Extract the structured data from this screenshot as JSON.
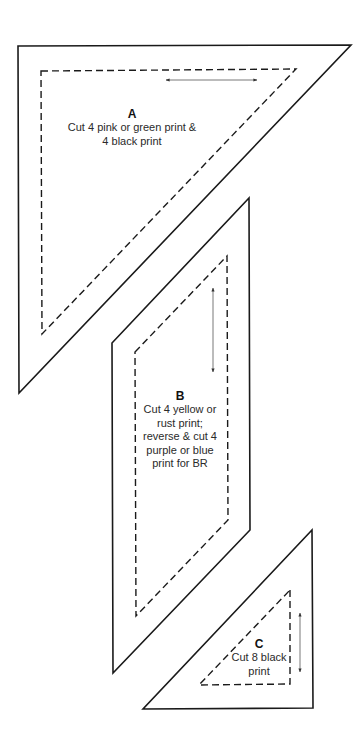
{
  "pieces": [
    {
      "id": "A",
      "letter": "A",
      "instructions": [
        "Cut 4 pink or green print &",
        "4 black print"
      ],
      "grainline": "horizontal"
    },
    {
      "id": "B",
      "letter": "B",
      "instructions": [
        "Cut 4 yellow or",
        "rust print;",
        "reverse & cut 4",
        "purple or blue",
        "print for BR"
      ],
      "grainline": "vertical"
    },
    {
      "id": "C",
      "letter": "C",
      "instructions": [
        "Cut 8 black",
        "print"
      ],
      "grainline": "vertical"
    }
  ],
  "legend": {
    "outline": "cutting line (solid)",
    "seam": "sewing line (dashed)",
    "grain": "grainline arrow"
  },
  "colors": {
    "line": "#1a1a1a",
    "text": "#2a2a2a",
    "background": "#ffffff"
  }
}
